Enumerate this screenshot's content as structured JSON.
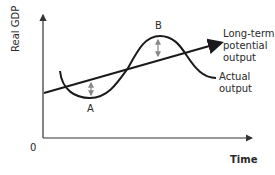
{
  "diagram": {
    "y_axis_label": "Real GDP",
    "x_axis_label": "Time",
    "origin_label": "0",
    "point_a_label": "A",
    "point_b_label": "B",
    "trend_line_label": [
      "Long-term",
      "potential",
      "output"
    ],
    "actual_curve_label": [
      "Actual",
      "output"
    ],
    "colors": {
      "line": "#1a1a1a",
      "axis": "#333333",
      "gap_arrow": "#888888"
    }
  }
}
